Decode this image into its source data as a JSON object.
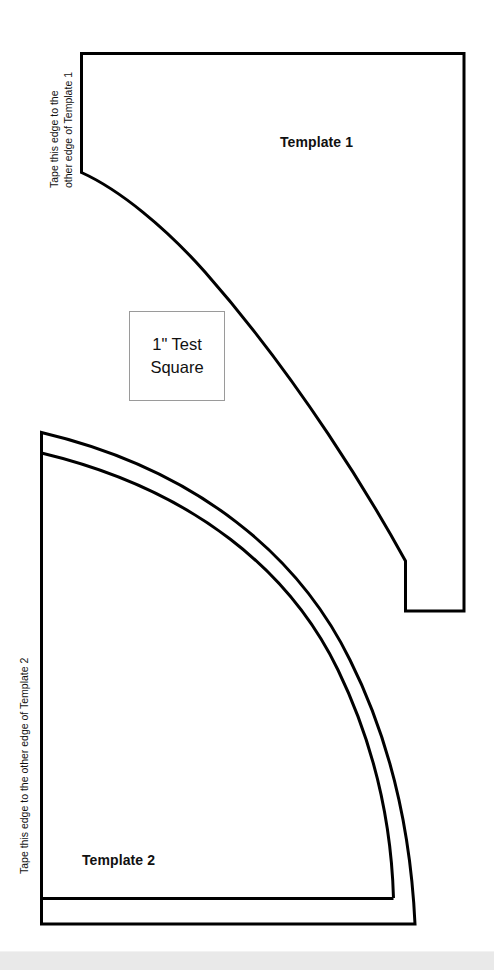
{
  "page": {
    "background_color": "#ffffff",
    "ink_color": "#000000",
    "bottom_strip_color": "#e9e9e9"
  },
  "template1": {
    "label": "Template 1",
    "tape_note_line1": "Tape this edge to the",
    "tape_note_line2": "other edge of Template 1"
  },
  "template2": {
    "label": "Template 2",
    "tape_note": "Tape this edge to the other edge of Template 2"
  },
  "test_square": {
    "line1": "1\" Test",
    "line2": "Square",
    "border_color": "#9a9a9a"
  }
}
